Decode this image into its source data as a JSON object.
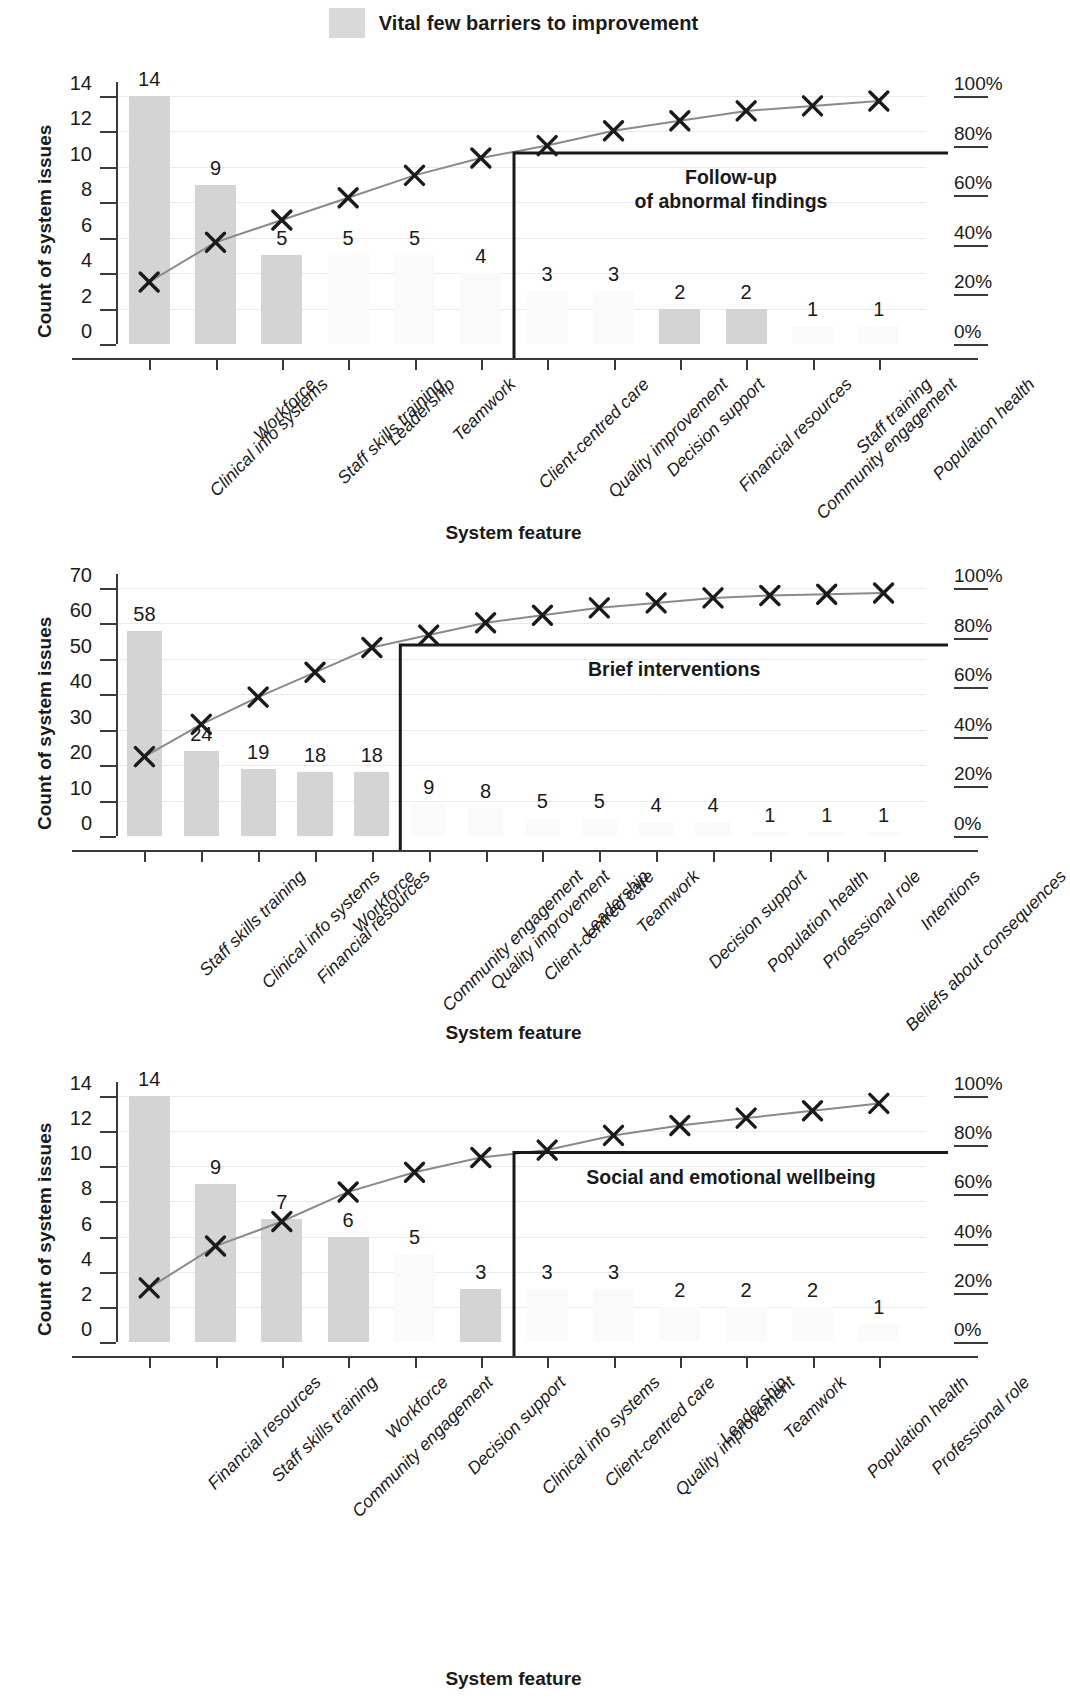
{
  "legend": {
    "label": "Vital few barriers to improvement",
    "swatch_color": "#d9d9d9"
  },
  "common": {
    "y_axis_title": "Count of system issues",
    "x_axis_title": "System feature",
    "percent_ticks": [
      "0%",
      "20%",
      "40%",
      "60%",
      "80%",
      "100%"
    ],
    "bar_color": "#d4d4d4",
    "faint_bar_color": "#fafafa",
    "line_color": "#8a8a8a",
    "marker_color": "#1a1a1a",
    "grid_color": "#e9e9ef",
    "axis_color": "#3a3a3a"
  },
  "chart_data": [
    {
      "id": "chart-1",
      "type": "bar",
      "title": "",
      "annotation": "Follow-up\nof abnormal findings",
      "xlabel": "System feature",
      "ylabel": "Count of system issues",
      "ylim": [
        0,
        14
      ],
      "yticks": [
        0,
        2,
        4,
        6,
        8,
        10,
        12,
        14
      ],
      "ytick_labels": [
        "0",
        "2",
        "4",
        "6",
        "8",
        "10",
        "12",
        "14"
      ],
      "y2lim": [
        0,
        100
      ],
      "y2ticks": [
        0,
        20,
        40,
        60,
        80,
        100
      ],
      "y2tick_labels": [
        "0%",
        "20%",
        "40%",
        "60%",
        "80%",
        "100%"
      ],
      "grid": true,
      "legend_position": "top-center",
      "vital_few_count": 6,
      "categories": [
        "Clinical info systems",
        "Workforce",
        "Staff skills training",
        "Leadership",
        "Teamwork",
        "Client-centred care",
        "Quality improvement",
        "Decision support",
        "Financial resources",
        "Community engagement",
        "Staff training",
        "Population health"
      ],
      "values": [
        14,
        9,
        5,
        5,
        5,
        4,
        3,
        3,
        2,
        2,
        1,
        1
      ],
      "value_labels": [
        "14",
        "9",
        "5",
        "5",
        "5",
        "4",
        "3",
        "3",
        "2",
        "2",
        "1",
        "1"
      ],
      "bar_visible": [
        true,
        true,
        true,
        false,
        false,
        false,
        false,
        false,
        true,
        true,
        false,
        false
      ],
      "cumulative_percent": [
        25,
        41,
        50,
        59,
        68,
        75,
        80,
        86,
        90,
        94,
        96,
        98
      ]
    },
    {
      "id": "chart-2",
      "type": "bar",
      "title": "",
      "annotation": "Brief interventions",
      "xlabel": "System feature",
      "ylabel": "Count of system issues",
      "ylim": [
        0,
        70
      ],
      "yticks": [
        0,
        10,
        20,
        30,
        40,
        50,
        60,
        70
      ],
      "ytick_labels": [
        "0",
        "10",
        "20",
        "30",
        "40",
        "50",
        "60",
        "70"
      ],
      "y2lim": [
        0,
        100
      ],
      "y2ticks": [
        0,
        20,
        40,
        60,
        80,
        100
      ],
      "y2tick_labels": [
        "0%",
        "20%",
        "40%",
        "60%",
        "80%",
        "100%"
      ],
      "grid": true,
      "vital_few_count": 5,
      "categories": [
        "Staff skills training",
        "Clinical info systems",
        "Financial resources",
        "Workforce",
        "Community engagement",
        "Quality improvement",
        "Client-centred care",
        "Leadership",
        "Teamwork",
        "Decision support",
        "Population health",
        "Professional role",
        "Beliefs about consequences",
        "Intentions"
      ],
      "values": [
        58,
        24,
        19,
        18,
        18,
        9,
        8,
        5,
        5,
        4,
        4,
        1,
        1,
        1
      ],
      "value_labels": [
        "58",
        "24",
        "19",
        "18",
        "18",
        "9",
        "8",
        "5",
        "5",
        "4",
        "4",
        "1",
        "1",
        "1"
      ],
      "bar_visible": [
        true,
        true,
        true,
        true,
        true,
        false,
        false,
        false,
        false,
        false,
        false,
        false,
        false,
        false
      ],
      "cumulative_percent": [
        32,
        45,
        56,
        66,
        76,
        81,
        86,
        89,
        92,
        94,
        96,
        97,
        97.5,
        98
      ]
    },
    {
      "id": "chart-3",
      "type": "bar",
      "title": "",
      "annotation": "Social and emotional wellbeing",
      "xlabel": "System feature",
      "ylabel": "Count of system issues",
      "ylim": [
        0,
        14
      ],
      "yticks": [
        0,
        2,
        4,
        6,
        8,
        10,
        12,
        14
      ],
      "ytick_labels": [
        "0",
        "2",
        "4",
        "6",
        "8",
        "10",
        "12",
        "14"
      ],
      "y2lim": [
        0,
        100
      ],
      "y2ticks": [
        0,
        20,
        40,
        60,
        80,
        100
      ],
      "y2tick_labels": [
        "0%",
        "20%",
        "40%",
        "60%",
        "80%",
        "100%"
      ],
      "grid": true,
      "vital_few_count": 6,
      "categories": [
        "Financial resources",
        "Staff skills training",
        "Community engagement",
        "Workforce",
        "Decision support",
        "Clinical info systems",
        "Client-centred care",
        "Quality improvement",
        "Leadership",
        "Teamwork",
        "Population health",
        "Professional role"
      ],
      "values": [
        14,
        9,
        7,
        6,
        5,
        3,
        3,
        3,
        2,
        2,
        2,
        1
      ],
      "value_labels": [
        "14",
        "9",
        "7",
        "6",
        "5",
        "3",
        "3",
        "3",
        "2",
        "2",
        "2",
        "1"
      ],
      "bar_visible": [
        true,
        true,
        true,
        true,
        false,
        true,
        false,
        false,
        false,
        false,
        false,
        false
      ],
      "cumulative_percent": [
        22,
        39,
        49,
        61,
        69,
        75,
        78,
        84,
        88,
        91,
        94,
        97
      ]
    }
  ]
}
